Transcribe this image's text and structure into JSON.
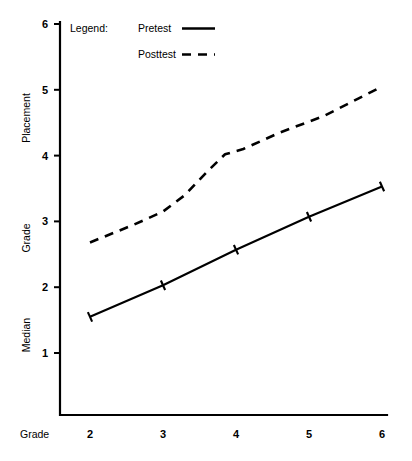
{
  "chart_data": {
    "type": "line",
    "title": "",
    "subtitle": "",
    "xlabel": "Grade",
    "ylabel": "Median Grade Placement",
    "xlim": [
      1.6,
      6.1
    ],
    "ylim": [
      0.25,
      6.0
    ],
    "grid": false,
    "legend_position": "top-left",
    "legend_title": "Legend:",
    "x_ticks": [
      2,
      3,
      4,
      5,
      6
    ],
    "x_tick_labels": [
      "2",
      "3",
      "4",
      "5",
      "6"
    ],
    "y_ticks": [
      1,
      2,
      3,
      4,
      5,
      6
    ],
    "y_tick_labels": [
      "1",
      "2",
      "3",
      "4",
      "5",
      "6"
    ],
    "categories": [
      2,
      3,
      4,
      5,
      6
    ],
    "series": [
      {
        "name": "Pretest",
        "style": "solid",
        "marker": "tick",
        "x": [
          2,
          3,
          4,
          5,
          6
        ],
        "values": [
          1.55,
          2.03,
          2.57,
          3.07,
          3.53
        ]
      },
      {
        "name": "Posttest",
        "style": "dashed",
        "marker": "none",
        "x": [
          2,
          2.6,
          3,
          3.3,
          3.6,
          3.85,
          4.1,
          4.6,
          5.2,
          6
        ],
        "values": [
          2.68,
          2.95,
          3.15,
          3.4,
          3.75,
          4.02,
          4.1,
          4.35,
          4.6,
          5.05
        ]
      }
    ]
  },
  "axes": {
    "y_axis_caption": "Median Grade Placement",
    "y_caption_parts": [
      "Placement",
      "Grade",
      "Median"
    ],
    "x_axis_caption": "Grade"
  },
  "legend": {
    "title": "Legend:",
    "entries": [
      {
        "label": "Pretest",
        "line_style": "solid"
      },
      {
        "label": "Posttest",
        "line_style": "dashed"
      }
    ]
  },
  "colors": {
    "ink": "#000000",
    "background": "#ffffff"
  }
}
